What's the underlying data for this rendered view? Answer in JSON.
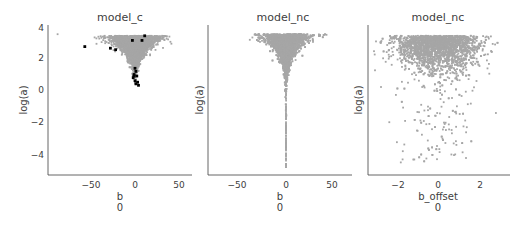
{
  "chart_data": [
    {
      "type": "scatter",
      "title": "model_c",
      "xlabel": "b\n0",
      "ylabel": "log(a)",
      "xticks": [
        -50,
        0,
        50
      ],
      "yticks": [
        4,
        2,
        0,
        -2,
        -4
      ],
      "xlim": [
        -95,
        65
      ],
      "ylim": [
        -5.3,
        4.2
      ],
      "grid": false,
      "series": [
        {
          "name": "samples",
          "color": "#a6a6a6",
          "description": "dense V-shaped cloud, log(a) ~0.3 to 3.6, b spread widens with log(a) up to ~±60"
        },
        {
          "name": "divergences",
          "color": "#000000",
          "points": [
            [
              -57,
              2.8
            ],
            [
              -28,
              2.7
            ],
            [
              -22,
              2.6
            ],
            [
              -3,
              3.2
            ],
            [
              8,
              3.2
            ],
            [
              11,
              3.5
            ],
            [
              0,
              1.4
            ],
            [
              1,
              1.2
            ],
            [
              -1,
              1.0
            ],
            [
              2,
              0.9
            ],
            [
              -2,
              0.8
            ],
            [
              0,
              0.6
            ],
            [
              3,
              0.5
            ],
            [
              1,
              0.4
            ],
            [
              4,
              0.3
            ],
            [
              -1,
              0.9
            ]
          ]
        }
      ]
    },
    {
      "type": "scatter",
      "title": "model_nc",
      "xlabel": "b\n0",
      "ylabel": "log(a)",
      "xticks": [
        -50,
        0,
        50
      ],
      "yticks": [],
      "xlim": [
        -80,
        65
      ],
      "ylim": [
        -5.3,
        4.2
      ],
      "grid": false,
      "series": [
        {
          "name": "samples",
          "color": "#a6a6a6",
          "description": "funnel: wide at top (log(a)~3.5, b ±60), narrowing to b≈0 down to log(a)≈-5"
        }
      ]
    },
    {
      "type": "scatter",
      "title": "model_nc",
      "xlabel": "b_offset\n0",
      "ylabel": "log(a)",
      "xticks": [
        -2,
        0,
        2
      ],
      "yticks": [],
      "xlim": [
        -3.4,
        3.3
      ],
      "ylim": [
        -5.3,
        4.2
      ],
      "grid": false,
      "series": [
        {
          "name": "samples",
          "color": "#a6a6a6",
          "description": "roughly Gaussian b_offset (sd~1) with dense band at log(a) 2-4 thinning downward"
        }
      ]
    }
  ],
  "panels": [
    {
      "title": "model_c",
      "xlabel": "b",
      "xsub": "0",
      "ylabel": "log(a)",
      "xticks": [
        "−50",
        "0",
        "50"
      ],
      "yticks": [
        "4",
        "2",
        "0",
        "−2",
        "−4"
      ]
    },
    {
      "title": "model_nc",
      "xlabel": "b",
      "xsub": "0",
      "ylabel": "log(a)",
      "xticks": [
        "−50",
        "0",
        "50"
      ]
    },
    {
      "title": "model_nc",
      "xlabel": "b_offset",
      "xsub": "0",
      "ylabel": "log(a)",
      "xticks": [
        "−2",
        "0",
        "2"
      ]
    }
  ],
  "colors": {
    "sample": "#a6a6a6",
    "divergence": "#000000",
    "axis": "#404040"
  }
}
